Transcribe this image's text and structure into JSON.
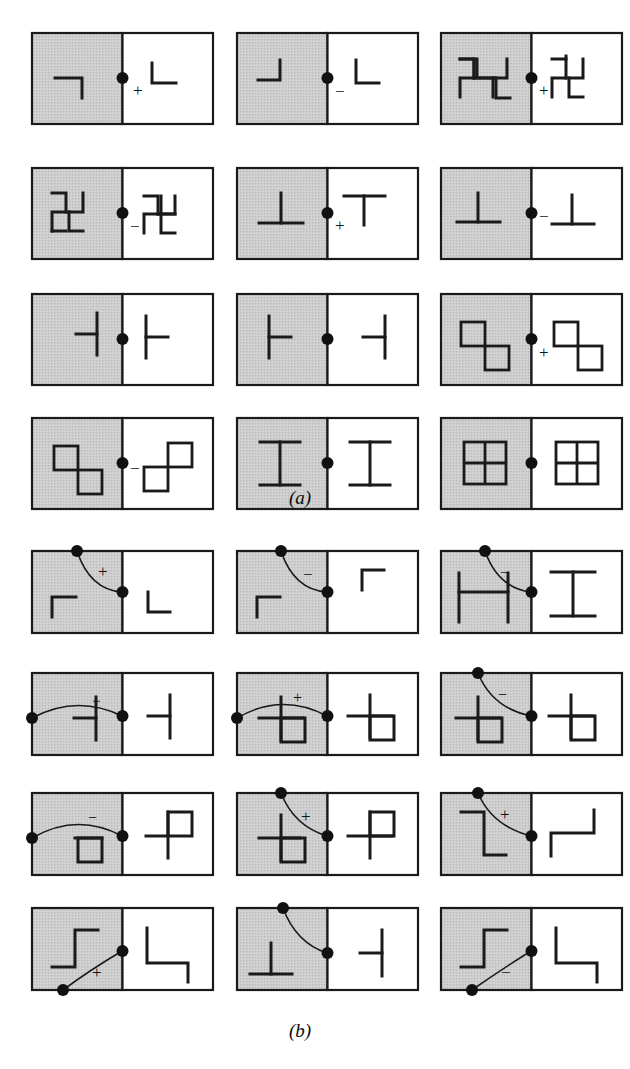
{
  "figure": {
    "kind": "crystallographic-symmetry-diagram-grid",
    "width": 630,
    "height": 1069,
    "background": "#ffffff",
    "ink": "#1a1a1a",
    "shaded_fill": "#cfcfcf",
    "unshaded_fill": "#ffffff",
    "border_color": "#1a1a1a"
  },
  "panels": [
    {
      "id": "a",
      "label": "(a)",
      "label_x": 300,
      "label_y": 498,
      "columns": 3,
      "rows": 4,
      "cells": [
        {
          "row": 0,
          "col": 0,
          "sign": "+",
          "sign_pos": "right-below",
          "left_symbol": "corner-tr",
          "right_symbol": "corner-bl",
          "dot": "center"
        },
        {
          "row": 0,
          "col": 1,
          "sign": "−",
          "sign_pos": "right-below",
          "left_symbol": "corner-br",
          "right_symbol": "corner-bl",
          "dot": "center"
        },
        {
          "row": 0,
          "col": 2,
          "sign": "+",
          "sign_pos": "right-below",
          "left_symbol": "swastika-cw",
          "right_symbol": "swastika-cw",
          "dot": "center"
        },
        {
          "row": 1,
          "col": 0,
          "sign": "−",
          "sign_pos": "right-below",
          "left_symbol": "swastika-cw",
          "right_symbol": "swastika-ccw",
          "dot": "center"
        },
        {
          "row": 1,
          "col": 1,
          "sign": "+",
          "sign_pos": "right-below",
          "left_symbol": "tee-up",
          "right_symbol": "tee-down",
          "dot": "center"
        },
        {
          "row": 1,
          "col": 2,
          "sign": "−",
          "sign_pos": "right-below",
          "left_symbol": "tee-up",
          "right_symbol": "tee-up",
          "dot": "center"
        },
        {
          "row": 2,
          "col": 0,
          "sign": "",
          "sign_pos": "",
          "left_symbol": "tee-left",
          "right_symbol": "tee-right",
          "dot": "center"
        },
        {
          "row": 2,
          "col": 1,
          "sign": "",
          "sign_pos": "",
          "left_symbol": "tee-right",
          "right_symbol": "tee-left",
          "dot": "center"
        },
        {
          "row": 2,
          "col": 2,
          "sign": "+",
          "sign_pos": "right-below",
          "left_symbol": "two-squares-diag",
          "right_symbol": "two-squares-diag",
          "dot": "center"
        },
        {
          "row": 3,
          "col": 0,
          "sign": "−",
          "sign_pos": "right-below",
          "left_symbol": "two-squares-diag",
          "right_symbol": "two-squares-antidiag",
          "dot": "center"
        },
        {
          "row": 3,
          "col": 1,
          "sign": "",
          "sign_pos": "",
          "left_symbol": "i-beam",
          "right_symbol": "i-beam",
          "dot": "center"
        },
        {
          "row": 3,
          "col": 2,
          "sign": "",
          "sign_pos": "",
          "left_symbol": "four-pane",
          "right_symbol": "four-pane",
          "dot": "center"
        }
      ]
    },
    {
      "id": "b",
      "label": "(b)",
      "label_x": 300,
      "label_y": 1032,
      "columns": 3,
      "rows": 4,
      "cells": [
        {
          "row": 0,
          "col": 0,
          "sign": "+",
          "arc": "top-to-mid",
          "left_symbol": "corner-tl",
          "right_symbol": "corner-bl",
          "dots": [
            "top-left-arc",
            "mid-right"
          ]
        },
        {
          "row": 0,
          "col": 1,
          "sign": "−",
          "arc": "top-to-mid",
          "left_symbol": "corner-tl",
          "right_symbol": "corner-tl",
          "dots": [
            "top-left-arc",
            "mid-right"
          ]
        },
        {
          "row": 0,
          "col": 2,
          "sign": "−",
          "arc": "top-to-mid",
          "left_symbol": "tee-left-bars",
          "right_symbol": "i-beam",
          "dots": [
            "top-left-arc",
            "mid-right"
          ]
        },
        {
          "row": 1,
          "col": 0,
          "sign": "−",
          "arc": "left-to-mid",
          "left_symbol": "cross-left",
          "right_symbol": "tee-left",
          "dots": [
            "mid-left",
            "mid-right"
          ]
        },
        {
          "row": 1,
          "col": 1,
          "sign": "+",
          "arc": "left-to-mid",
          "left_symbol": "cross-square",
          "right_symbol": "cross-square",
          "dots": [
            "mid-left",
            "mid-right"
          ]
        },
        {
          "row": 1,
          "col": 2,
          "sign": "−",
          "arc": "top-to-mid",
          "left_symbol": "cross-square",
          "right_symbol": "cross-square",
          "dots": [
            "top-left-arc",
            "mid-right"
          ]
        },
        {
          "row": 2,
          "col": 0,
          "sign": "−",
          "arc": "left-to-mid",
          "left_symbol": "cross-square",
          "right_symbol": "cross-square-up",
          "dots": [
            "mid-left",
            "mid-right"
          ]
        },
        {
          "row": 2,
          "col": 1,
          "sign": "+",
          "arc": "top-to-mid",
          "left_symbol": "cross-square",
          "right_symbol": "cross-square-up",
          "dots": [
            "top-left-arc",
            "mid-right"
          ]
        },
        {
          "row": 2,
          "col": 2,
          "sign": "+",
          "arc": "top-to-mid",
          "left_symbol": "step-down",
          "right_symbol": "step-corner",
          "dots": [
            "top-left-arc",
            "mid-right"
          ]
        },
        {
          "row": 3,
          "col": 0,
          "sign": "+",
          "arc": "bottom-to-mid",
          "left_symbol": "step-up",
          "right_symbol": "step-corner2",
          "dots": [
            "bottom-left-arc",
            "mid-right"
          ]
        },
        {
          "row": 3,
          "col": 1,
          "sign": "",
          "arc": "top-to-mid",
          "left_symbol": "tee-up",
          "right_symbol": "tee-left",
          "dots": [
            "top-left-arc",
            "mid-right"
          ]
        },
        {
          "row": 3,
          "col": 2,
          "sign": "−",
          "arc": "bottom-to-mid",
          "left_symbol": "step-up",
          "right_symbol": "step-corner",
          "dots": [
            "bottom-left-arc",
            "mid-right"
          ]
        }
      ]
    }
  ],
  "geometry": {
    "cell_width": 181,
    "cell_height": 91,
    "col_x": [
      32,
      237,
      441
    ],
    "panel_a_row_y": [
      33,
      168,
      294,
      418
    ],
    "panel_b_row_y": [
      551,
      673,
      793,
      908
    ]
  }
}
